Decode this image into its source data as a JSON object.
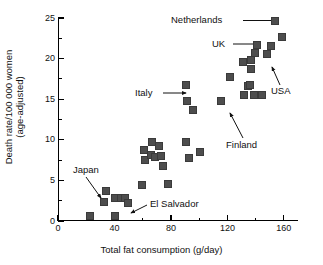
{
  "chart_data": {
    "type": "scatter",
    "title": "",
    "xlabel": "Total fat consumption (g/day)",
    "ylabel": "Death rate/100 000 women (age-adjusted)",
    "ylabel_lines": [
      "Death rate/100 000 women",
      "(age-adjusted)"
    ],
    "xlim": [
      0,
      170
    ],
    "ylim": [
      0,
      25
    ],
    "grid": false,
    "legend": "none",
    "x_major_ticks": [
      0,
      40,
      80,
      120,
      160
    ],
    "x_minor_ticks": [
      20,
      60,
      100,
      140
    ],
    "y_major_ticks": [
      0,
      5,
      10,
      15,
      20,
      25
    ],
    "y_minor_ticks": [
      2.5,
      7.5,
      12.5,
      17.5,
      22.5
    ],
    "x_tick_labels": [
      "0",
      "40",
      "80",
      "120",
      "160"
    ],
    "y_tick_labels": [
      "0",
      "5",
      "10",
      "15",
      "20",
      "25"
    ],
    "marker": "square",
    "marker_color": "#4d4d4d",
    "points": [
      {
        "x": 22,
        "y": 0.8
      },
      {
        "x": 32,
        "y": 2.5
      },
      {
        "x": 33,
        "y": 3.8
      },
      {
        "x": 40,
        "y": 0.8
      },
      {
        "x": 40,
        "y": 3.0
      },
      {
        "x": 44,
        "y": 3.0
      },
      {
        "x": 47,
        "y": 3.0
      },
      {
        "x": 49,
        "y": 2.3
      },
      {
        "x": 59,
        "y": 4.5
      },
      {
        "x": 60,
        "y": 8.9
      },
      {
        "x": 61,
        "y": 7.6
      },
      {
        "x": 65,
        "y": 8.3
      },
      {
        "x": 66,
        "y": 9.8
      },
      {
        "x": 68,
        "y": 8.0
      },
      {
        "x": 71,
        "y": 9.4
      },
      {
        "x": 72,
        "y": 8.1
      },
      {
        "x": 74,
        "y": 6.9
      },
      {
        "x": 77,
        "y": 4.7
      },
      {
        "x": 90,
        "y": 16.9
      },
      {
        "x": 90,
        "y": 9.8
      },
      {
        "x": 91,
        "y": 14.9
      },
      {
        "x": 92,
        "y": 7.9
      },
      {
        "x": 95,
        "y": 13.8
      },
      {
        "x": 100,
        "y": 8.6
      },
      {
        "x": 115,
        "y": 14.9
      },
      {
        "x": 121,
        "y": 17.8
      },
      {
        "x": 130,
        "y": 19.7
      },
      {
        "x": 131,
        "y": 15.7
      },
      {
        "x": 134,
        "y": 16.7
      },
      {
        "x": 135,
        "y": 16.9
      },
      {
        "x": 136,
        "y": 20.0
      },
      {
        "x": 136,
        "y": 18.8
      },
      {
        "x": 138,
        "y": 15.7
      },
      {
        "x": 139,
        "y": 20.8
      },
      {
        "x": 140,
        "y": 21.8
      },
      {
        "x": 144,
        "y": 15.7
      },
      {
        "x": 147,
        "y": 20.7
      },
      {
        "x": 150,
        "y": 21.7
      },
      {
        "x": 153,
        "y": 24.8
      },
      {
        "x": 158,
        "y": 22.8
      }
    ],
    "annotations": [
      {
        "label": "Netherlands",
        "point_x": 153,
        "point_y": 24.8
      },
      {
        "label": "UK",
        "point_x": 140,
        "point_y": 21.8
      },
      {
        "label": "USA",
        "point_x": 150,
        "point_y": 21.7
      },
      {
        "label": "Italy",
        "point_x": 90,
        "point_y": 16.9
      },
      {
        "label": "Finland",
        "point_x": 121,
        "point_y": 17.8
      },
      {
        "label": "Japan",
        "point_x": 33,
        "point_y": 3.8
      },
      {
        "label": "El Salvador",
        "point_x": 40,
        "point_y": 0.8
      }
    ]
  }
}
